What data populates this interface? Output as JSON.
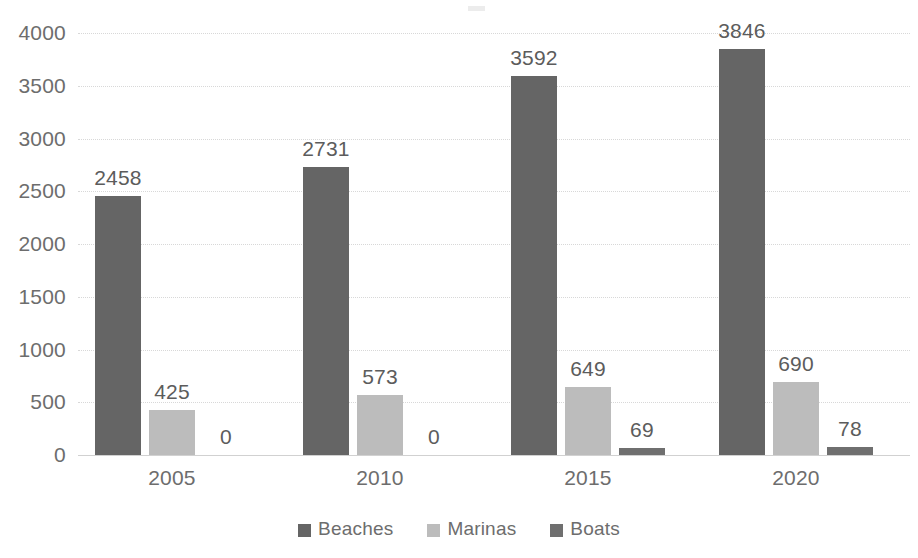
{
  "chart_data": {
    "type": "bar",
    "title": "",
    "subtitle": "",
    "xlabel": "",
    "ylabel": "",
    "categories": [
      "2005",
      "2010",
      "2015",
      "2020"
    ],
    "series": [
      {
        "name": "Beaches",
        "color": "#656565",
        "values": [
          2458,
          2731,
          3592,
          3846
        ]
      },
      {
        "name": "Marinas",
        "color": "#bcbcbc",
        "values": [
          425,
          573,
          649,
          690
        ]
      },
      {
        "name": "Boats",
        "color": "#6f6f6f",
        "values": [
          0,
          0,
          69,
          78
        ]
      }
    ],
    "data_labels": [
      [
        "2458",
        "425",
        "0"
      ],
      [
        "2731",
        "573",
        "0"
      ],
      [
        "3592",
        "649",
        "69"
      ],
      [
        "3846",
        "690",
        "78"
      ]
    ],
    "ylim": [
      0,
      4000
    ],
    "ytick_values": [
      0,
      500,
      1000,
      1500,
      2000,
      2500,
      3000,
      3500,
      4000
    ],
    "ytick_labels": [
      "0",
      "500",
      "1000",
      "1500",
      "2000",
      "2500",
      "3000",
      "3500",
      "4000"
    ],
    "grid": "horizontal-dotted",
    "legend_position": "bottom-center",
    "bar_grouping": "clustered"
  },
  "axis": {
    "y": {
      "ticks": [
        {
          "label": "4000",
          "value": 4000
        },
        {
          "label": "3500",
          "value": 3500
        },
        {
          "label": "3000",
          "value": 3000
        },
        {
          "label": "2500",
          "value": 2500
        },
        {
          "label": "2000",
          "value": 2000
        },
        {
          "label": "1500",
          "value": 1500
        },
        {
          "label": "1000",
          "value": 1000
        },
        {
          "label": "500",
          "value": 500
        },
        {
          "label": "0",
          "value": 0
        }
      ]
    },
    "x": {
      "ticks": [
        {
          "label": "2005"
        },
        {
          "label": "2010"
        },
        {
          "label": "2015"
        },
        {
          "label": "2020"
        }
      ]
    }
  },
  "legend": {
    "items": [
      {
        "label": "Beaches",
        "color": "#656565"
      },
      {
        "label": "Marinas",
        "color": "#bcbcbc"
      },
      {
        "label": "Boats",
        "color": "#6f6f6f"
      }
    ]
  },
  "colors": {
    "beaches": "#656565",
    "marinas": "#bcbcbc",
    "boats": "#6f6f6f",
    "gridline": "#d6d6d6",
    "baseline": "#cfcfcf",
    "tick_text": "#6d6d6d",
    "value_text": "#5c5c5c",
    "background": "#ffffff"
  }
}
